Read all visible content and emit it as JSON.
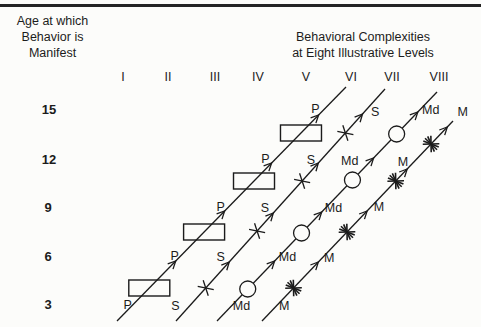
{
  "figure": {
    "bg": "#fcfcfa",
    "ink": "#1b1b1b",
    "rule_color": "#242424",
    "canvas": {
      "w": 481,
      "h": 327
    }
  },
  "left_axis": {
    "title_lines": [
      "Age at which",
      "Behavior is",
      "Manifest"
    ],
    "ages": [
      {
        "label": "15",
        "x": 49,
        "y": 109
      },
      {
        "label": "12",
        "x": 49,
        "y": 159
      },
      {
        "label": "9",
        "x": 48,
        "y": 207
      },
      {
        "label": "6",
        "x": 48,
        "y": 256
      },
      {
        "label": "3",
        "x": 48,
        "y": 304
      }
    ]
  },
  "top_axis": {
    "title_lines": [
      "Behavioral Complexities",
      "at Eight Illustrative Levels"
    ],
    "levels_y": 77,
    "levels": [
      {
        "label": "I",
        "x": 123
      },
      {
        "label": "II",
        "x": 168
      },
      {
        "label": "III",
        "x": 215
      },
      {
        "label": "IV",
        "x": 258
      },
      {
        "label": "V",
        "x": 306
      },
      {
        "label": "VI",
        "x": 351
      },
      {
        "label": "VII",
        "x": 392
      },
      {
        "label": "VIII",
        "x": 439
      }
    ]
  },
  "series": [
    {
      "id": "p-line",
      "label": "P",
      "symbol": "rect",
      "x1": 117,
      "y1": 321,
      "x2": 346,
      "y2": 87,
      "symbols_y": [
        288,
        232,
        181,
        133
      ],
      "arrows_y": [
        261,
        211,
        163,
        115
      ],
      "labels": [
        {
          "y": 305,
          "dx": -5
        },
        {
          "y": 256,
          "dx": -6
        },
        {
          "y": 207,
          "dx": -8
        },
        {
          "y": 159,
          "dx": -10
        },
        {
          "y": 109,
          "dx": -9
        }
      ]
    },
    {
      "id": "s-line",
      "label": "S",
      "symbol": "cross",
      "x1": 176,
      "y1": 321,
      "x2": 385,
      "y2": 89,
      "symbols_y": [
        288,
        231,
        181,
        133
      ],
      "arrows_y": [
        262,
        213,
        163,
        114
      ],
      "labels": [
        {
          "y": 306,
          "dx": -14
        },
        {
          "y": 257,
          "dx": -13
        },
        {
          "y": 208,
          "dx": -13
        },
        {
          "y": 160,
          "dx": -10
        },
        {
          "y": 112,
          "dx": 11
        }
      ]
    },
    {
      "id": "md-line",
      "label": "Md",
      "symbol": "circle",
      "x1": 217,
      "y1": 321,
      "x2": 437,
      "y2": 92,
      "symbols_y": [
        289,
        233,
        180,
        134
      ],
      "arrows_y": [
        261,
        212,
        158,
        112
      ],
      "labels": [
        {
          "y": 306,
          "dx": 10
        },
        {
          "y": 257,
          "dx": 9
        },
        {
          "y": 208,
          "dx": 8
        },
        {
          "y": 161,
          "dx": -21
        },
        {
          "y": 110,
          "dx": 11
        }
      ]
    },
    {
      "id": "m-line",
      "label": "M",
      "symbol": "asterisk",
      "x1": 262,
      "y1": 321,
      "x2": 453,
      "y2": 121,
      "symbols_y": [
        288,
        232,
        181,
        144
      ],
      "arrows_y": [
        262,
        211,
        169,
        127
      ],
      "labels": [
        {
          "y": 306,
          "dx": 8
        },
        {
          "y": 258,
          "dx": 7
        },
        {
          "y": 207,
          "dx": 8
        },
        {
          "y": 162,
          "dx": -11
        },
        {
          "y": 112,
          "dx": 1
        }
      ]
    }
  ]
}
